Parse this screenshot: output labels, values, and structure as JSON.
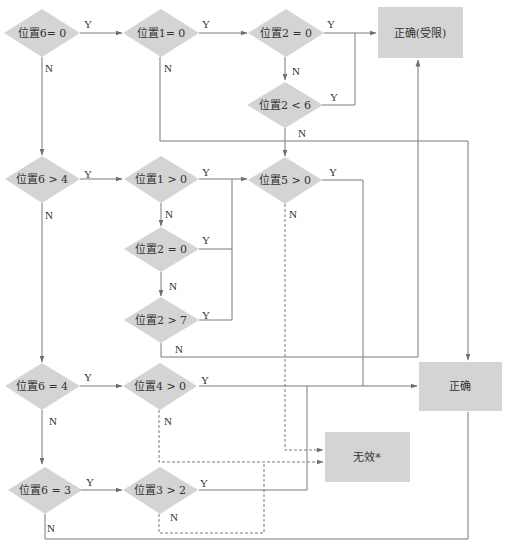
{
  "colors": {
    "node_fill": "#d4d4d4",
    "line": "#7a7a7a",
    "text": "#333333",
    "background": "#ffffff"
  },
  "nodes": {
    "d_pos6_eq0": {
      "label": "位置6= 0",
      "type": "decision"
    },
    "d_pos1_eq0": {
      "label": "位置1= 0",
      "type": "decision"
    },
    "d_pos2_eq0a": {
      "label": "位置2 = 0",
      "type": "decision"
    },
    "d_pos2_lt6": {
      "label": "位置2 < 6",
      "type": "decision"
    },
    "t_correct_limited": {
      "label": "正确(受限)",
      "type": "terminal"
    },
    "d_pos6_gt4": {
      "label": "位置6 > 4",
      "type": "decision"
    },
    "d_pos1_gt0": {
      "label": "位置1 > 0",
      "type": "decision"
    },
    "d_pos5_gt0": {
      "label": "位置5 > 0",
      "type": "decision"
    },
    "d_pos2_eq0b": {
      "label": "位置2 = 0",
      "type": "decision"
    },
    "d_pos2_gt7": {
      "label": "位置2 > 7",
      "type": "decision"
    },
    "d_pos6_eq4": {
      "label": "位置6 = 4",
      "type": "decision"
    },
    "d_pos4_gt0": {
      "label": "位置4 > 0",
      "type": "decision"
    },
    "t_correct": {
      "label": "正确",
      "type": "terminal"
    },
    "t_invalid": {
      "label": "无效*",
      "type": "terminal"
    },
    "d_pos6_eq3": {
      "label": "位置6 = 3",
      "type": "decision"
    },
    "d_pos3_gt2": {
      "label": "位置3 > 2",
      "type": "decision"
    }
  },
  "edges": {
    "e1": {
      "from": "位置6= 0",
      "to": "位置1= 0",
      "label": "Y",
      "style": "solid"
    },
    "e2": {
      "from": "位置6= 0",
      "to": "位置6 > 4",
      "label": "N",
      "style": "solid"
    },
    "e3": {
      "from": "位置1= 0",
      "to": "位置2 = 0",
      "label": "Y",
      "style": "solid"
    },
    "e4": {
      "from": "位置1= 0",
      "to": "正确",
      "label": "N",
      "style": "solid"
    },
    "e5": {
      "from": "位置2 = 0",
      "to": "正确(受限)",
      "label": "Y",
      "style": "solid"
    },
    "e6": {
      "from": "位置2 = 0",
      "to": "位置2 < 6",
      "label": "N",
      "style": "solid"
    },
    "e7": {
      "from": "位置2 < 6",
      "to": "正确(受限)",
      "label": "Y",
      "style": "solid"
    },
    "e8": {
      "from": "位置2 < 6",
      "to": "位置5 > 0",
      "label": "N",
      "style": "solid"
    },
    "e9": {
      "from": "位置6 > 4",
      "to": "位置1 > 0",
      "label": "Y",
      "style": "solid"
    },
    "e10": {
      "from": "位置6 > 4",
      "to": "位置6 = 4",
      "label": "N",
      "style": "solid"
    },
    "e11": {
      "from": "位置1 > 0",
      "to": "位置5 > 0",
      "label": "Y",
      "style": "solid"
    },
    "e12": {
      "from": "位置1 > 0",
      "to": "位置2 = 0",
      "label": "N",
      "style": "solid"
    },
    "e13": {
      "from": "位置2 = 0",
      "to": "位置5 > 0",
      "label": "Y",
      "style": "solid"
    },
    "e14": {
      "from": "位置2 = 0",
      "to": "位置2 > 7",
      "label": "N",
      "style": "solid"
    },
    "e15": {
      "from": "位置2 > 7",
      "to": "位置5 > 0",
      "label": "Y",
      "style": "solid"
    },
    "e16": {
      "from": "位置2 > 7",
      "to": "正确(受限)",
      "label": "N",
      "style": "solid"
    },
    "e17": {
      "from": "位置5 > 0",
      "to": "正确",
      "label": "Y",
      "style": "solid"
    },
    "e18": {
      "from": "位置5 > 0",
      "to": "无效*",
      "label": "N",
      "style": "dashed"
    },
    "e19": {
      "from": "位置6 = 4",
      "to": "位置4 > 0",
      "label": "Y",
      "style": "solid"
    },
    "e20": {
      "from": "位置6 = 4",
      "to": "位置6 = 3",
      "label": "N",
      "style": "solid"
    },
    "e21": {
      "from": "位置4 > 0",
      "to": "正确",
      "label": "Y",
      "style": "solid"
    },
    "e22": {
      "from": "位置4 > 0",
      "to": "无效*",
      "label": "N",
      "style": "dashed"
    },
    "e23": {
      "from": "位置6 = 3",
      "to": "位置3 > 2",
      "label": "Y",
      "style": "solid"
    },
    "e24": {
      "from": "位置6 = 3",
      "to": "正确",
      "label": "N",
      "style": "solid"
    },
    "e25": {
      "from": "位置3 > 2",
      "to": "正确",
      "label": "Y",
      "style": "solid"
    },
    "e26": {
      "from": "位置3 > 2",
      "to": "无效*",
      "label": "N",
      "style": "dashed"
    }
  }
}
